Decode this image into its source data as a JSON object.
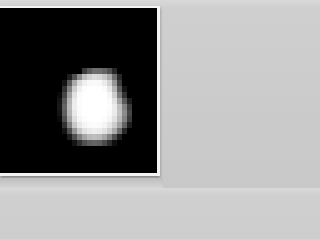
{
  "image": {
    "subject": "pixelated bright irregular object on black background",
    "background_color": "#000000",
    "frame_color": "#f4f4f4",
    "page_color": "#d0d0d0"
  },
  "blob_grid": {
    "cols": 20,
    "rows": 16,
    "intensity": [
      [
        0,
        0,
        0,
        0,
        0,
        0,
        0,
        0,
        0,
        0,
        0,
        0,
        0,
        0,
        0,
        0,
        0,
        0,
        0,
        0
      ],
      [
        0,
        0,
        0,
        0,
        0,
        0,
        0,
        0,
        0,
        0,
        0,
        0,
        0,
        0,
        0,
        0,
        0,
        0,
        0,
        0
      ],
      [
        0,
        0,
        0,
        0,
        0,
        0,
        0,
        0,
        60,
        90,
        110,
        110,
        100,
        80,
        40,
        0,
        0,
        0,
        0,
        0
      ],
      [
        0,
        0,
        0,
        0,
        0,
        30,
        80,
        140,
        190,
        210,
        220,
        215,
        200,
        170,
        110,
        40,
        0,
        0,
        0,
        0
      ],
      [
        0,
        0,
        0,
        0,
        20,
        90,
        170,
        220,
        240,
        248,
        250,
        248,
        235,
        210,
        150,
        60,
        0,
        0,
        0,
        0
      ],
      [
        0,
        0,
        0,
        0,
        50,
        130,
        205,
        240,
        252,
        255,
        255,
        255,
        250,
        230,
        180,
        90,
        20,
        0,
        0,
        0
      ],
      [
        0,
        0,
        0,
        10,
        70,
        160,
        225,
        250,
        255,
        255,
        255,
        255,
        255,
        245,
        205,
        120,
        50,
        0,
        0,
        0
      ],
      [
        0,
        0,
        0,
        20,
        90,
        180,
        235,
        252,
        255,
        255,
        255,
        255,
        255,
        250,
        225,
        160,
        90,
        30,
        0,
        0
      ],
      [
        0,
        0,
        0,
        25,
        100,
        185,
        238,
        252,
        255,
        255,
        255,
        255,
        255,
        252,
        235,
        190,
        130,
        60,
        0,
        0
      ],
      [
        0,
        0,
        0,
        20,
        95,
        180,
        232,
        250,
        255,
        255,
        255,
        255,
        255,
        250,
        235,
        195,
        140,
        70,
        0,
        0
      ],
      [
        0,
        0,
        0,
        10,
        80,
        165,
        222,
        245,
        252,
        255,
        255,
        255,
        252,
        245,
        225,
        185,
        130,
        60,
        0,
        0
      ],
      [
        0,
        0,
        0,
        0,
        50,
        130,
        200,
        232,
        245,
        250,
        252,
        250,
        245,
        230,
        205,
        160,
        100,
        30,
        0,
        0
      ],
      [
        0,
        0,
        0,
        0,
        20,
        80,
        150,
        200,
        225,
        235,
        238,
        235,
        225,
        205,
        170,
        110,
        40,
        0,
        0,
        0
      ],
      [
        0,
        0,
        0,
        0,
        0,
        30,
        80,
        130,
        165,
        185,
        190,
        185,
        165,
        130,
        80,
        30,
        0,
        0,
        0,
        0
      ],
      [
        0,
        0,
        0,
        0,
        0,
        0,
        20,
        50,
        80,
        95,
        100,
        95,
        75,
        45,
        15,
        0,
        0,
        0,
        0,
        0
      ],
      [
        0,
        0,
        0,
        0,
        0,
        0,
        0,
        0,
        0,
        0,
        0,
        0,
        0,
        0,
        0,
        0,
        0,
        0,
        0,
        0
      ]
    ]
  }
}
